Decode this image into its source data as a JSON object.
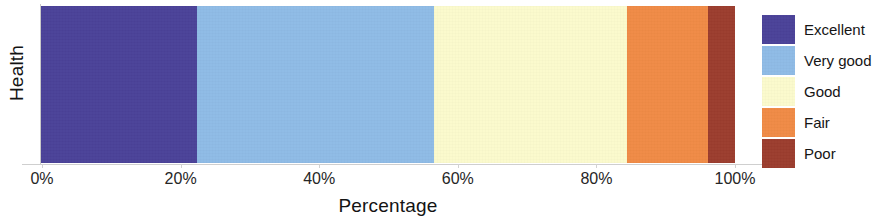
{
  "chart_data": {
    "type": "bar",
    "orientation": "horizontal",
    "stacked": true,
    "title": "",
    "xlabel": "Percentage",
    "ylabel": "Health",
    "categories": [
      "Health"
    ],
    "xlim": [
      0,
      100
    ],
    "grid": false,
    "legend_position": "right",
    "xtick_labels": [
      "0%",
      "20%",
      "40%",
      "60%",
      "80%",
      "100%"
    ],
    "xtick_values": [
      0,
      20,
      40,
      60,
      80,
      100
    ],
    "series": [
      {
        "name": "Excellent",
        "values": [
          22.5
        ],
        "color": "#4b4299"
      },
      {
        "name": "Very good",
        "values": [
          34.2
        ],
        "color": "#8fbbe6"
      },
      {
        "name": "Good",
        "values": [
          27.8
        ],
        "color": "#fbfacd"
      },
      {
        "name": "Fair",
        "values": [
          11.6
        ],
        "color": "#f08b46"
      },
      {
        "name": "Poor",
        "values": [
          3.9
        ],
        "color": "#9c3d2e"
      }
    ]
  },
  "axes": {
    "y_title": "Health",
    "x_title": "Percentage",
    "ticks": [
      {
        "label": "0%",
        "value": 0
      },
      {
        "label": "20%",
        "value": 20
      },
      {
        "label": "40%",
        "value": 40
      },
      {
        "label": "60%",
        "value": 60
      },
      {
        "label": "80%",
        "value": 80
      },
      {
        "label": "100%",
        "value": 100
      }
    ]
  },
  "legend": {
    "items": [
      {
        "label": "Excellent",
        "color": "#4b4299"
      },
      {
        "label": "Very good",
        "color": "#8fbbe6"
      },
      {
        "label": "Good",
        "color": "#fbfacd"
      },
      {
        "label": "Fair",
        "color": "#f08b46"
      },
      {
        "label": "Poor",
        "color": "#9c3d2e"
      }
    ]
  }
}
